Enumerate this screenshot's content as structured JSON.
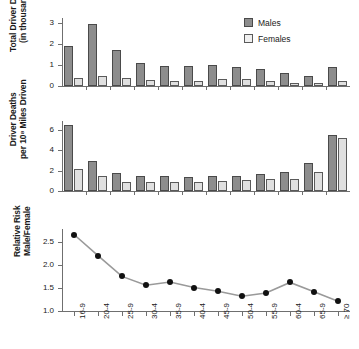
{
  "figure": {
    "panels": [
      "total-driver-deaths",
      "driver-death-rate",
      "relative-risk"
    ]
  },
  "legend": {
    "position": "top-right",
    "males_label": "Males",
    "females_label": "Females",
    "males_color": "#8d8d8d",
    "females_color": "#f0f0f0"
  },
  "chart_data": [
    {
      "type": "bar",
      "title": "",
      "xlabel": "",
      "ylabel": "Total Driver Deaths (in thousands)",
      "ylabel_line1": "Total Driver Deaths",
      "ylabel_line2": "(in thousands)",
      "categories": [
        "16-9",
        "20-4",
        "25-9",
        "30-4",
        "35-9",
        "40-4",
        "45-9",
        "50-4",
        "55-9",
        "60-4",
        "65-9",
        "≥ 70"
      ],
      "yticks": [
        "0",
        "1",
        "2",
        "3"
      ],
      "ylim": [
        0,
        3.25
      ],
      "grid": false,
      "series": [
        {
          "name": "Males",
          "color": "#8d8d8d",
          "values": [
            1.92,
            2.95,
            1.7,
            1.1,
            0.98,
            0.98,
            1.0,
            0.89,
            0.81,
            0.62,
            0.47,
            0.93
          ]
        },
        {
          "name": "Females",
          "color": "#e0e0e0",
          "values": [
            0.38,
            0.5,
            0.38,
            0.27,
            0.26,
            0.26,
            0.35,
            0.32,
            0.26,
            0.14,
            0.13,
            0.25
          ]
        }
      ]
    },
    {
      "type": "bar",
      "title": "",
      "xlabel": "",
      "ylabel": "Driver Deaths per 10^8 Miles Driven",
      "ylabel_line1": "Driver Deaths",
      "ylabel_line2": "per 10⁸ Miles Driven",
      "categories": [
        "16-9",
        "20-4",
        "25-9",
        "30-4",
        "35-9",
        "40-4",
        "45-9",
        "50-4",
        "55-9",
        "60-4",
        "65-9",
        "≥ 70"
      ],
      "yticks": [
        "0",
        "2",
        "4",
        "6"
      ],
      "ylim": [
        0,
        6.9
      ],
      "grid": false,
      "series": [
        {
          "name": "Males",
          "color": "#8d8d8d",
          "values": [
            6.5,
            3.0,
            1.75,
            1.45,
            1.45,
            1.4,
            1.53,
            1.52,
            1.7,
            1.85,
            2.78,
            5.55
          ]
        },
        {
          "name": "Females",
          "color": "#e0e0e0",
          "values": [
            2.22,
            1.45,
            0.9,
            0.86,
            0.85,
            0.86,
            1.03,
            1.1,
            1.18,
            1.22,
            1.85,
            5.22
          ]
        }
      ]
    },
    {
      "type": "line",
      "title": "",
      "xlabel": "",
      "ylabel": "Relative Risk Male/Female",
      "ylabel_line1": "Relative Risk",
      "ylabel_line2": "Male/Female",
      "categories": [
        "16-9",
        "20-4",
        "25-9",
        "30-4",
        "35-9",
        "40-4",
        "45-9",
        "50-4",
        "55-9",
        "60-4",
        "65-9",
        "≥ 70"
      ],
      "yticks": [
        "1.0",
        "1.5",
        "2.0",
        "2.5"
      ],
      "ylim": [
        1.0,
        2.78
      ],
      "grid": false,
      "marker": "filled-circle",
      "line_color": "#9a9a9a",
      "marker_color": "#111111",
      "series": [
        {
          "name": "Relative Risk Male/Female",
          "values": [
            2.66,
            2.2,
            1.75,
            1.56,
            1.63,
            1.51,
            1.43,
            1.32,
            1.39,
            1.62,
            1.42,
            1.21
          ]
        }
      ]
    }
  ]
}
